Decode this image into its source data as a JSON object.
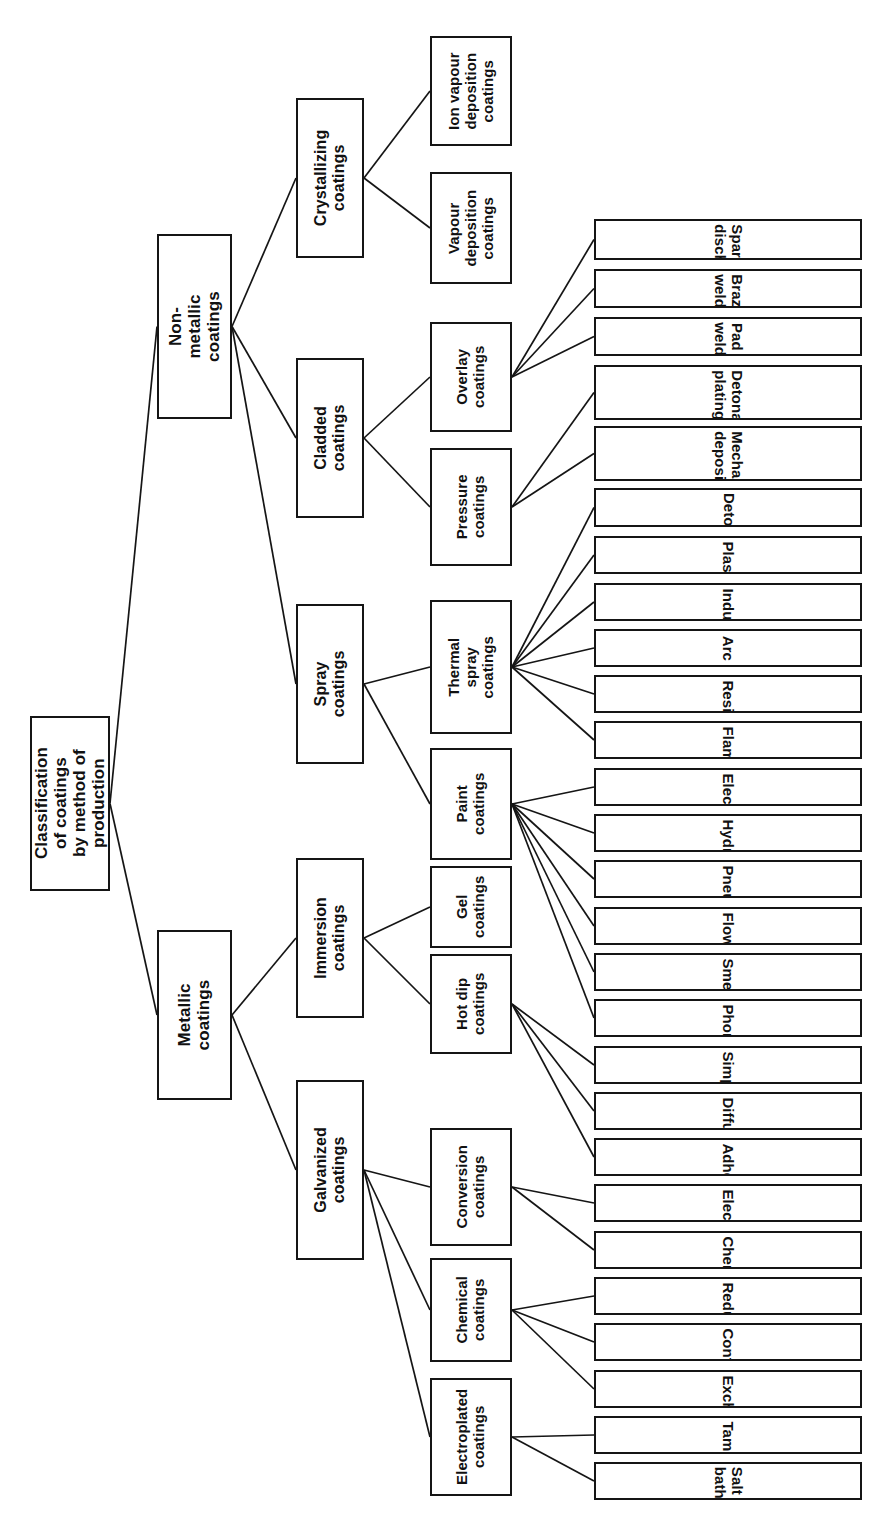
{
  "diagram": {
    "title": "Classification of coatings by method of production",
    "orientation": "rotated-90-ccw",
    "ink_color": "#151515",
    "background_color": "#ffffff"
  },
  "root": {
    "id": "root",
    "label": "Classification of coatings\nby method of production"
  },
  "level1": [
    {
      "id": "non-metallic",
      "label": "Non-metallic\ncoatings"
    },
    {
      "id": "metallic",
      "label": "Metallic\ncoatings"
    }
  ],
  "level2": [
    {
      "id": "crystallizing",
      "label": "Crystallizing\ncoatings",
      "parent": "non-metallic"
    },
    {
      "id": "cladded",
      "label": "Cladded\ncoatings",
      "parent": "non-metallic"
    },
    {
      "id": "spray",
      "label": "Spray\ncoatings",
      "parent": "non-metallic"
    },
    {
      "id": "immersion",
      "label": "Immersion\ncoatings",
      "parent": "metallic"
    },
    {
      "id": "galvanized",
      "label": "Galvanized\ncoatings",
      "parent": "metallic"
    }
  ],
  "level3": [
    {
      "id": "ion-vapour-deposition",
      "label": "Ion vapour\ndeposition\ncoatings",
      "parent": "crystallizing"
    },
    {
      "id": "vapour-deposition",
      "label": "Vapour\ndeposition\ncoatings",
      "parent": "crystallizing"
    },
    {
      "id": "overlay",
      "label": "Overlay\ncoatings",
      "parent": "cladded"
    },
    {
      "id": "pressure",
      "label": "Pressure\ncoatings",
      "parent": "cladded"
    },
    {
      "id": "thermal-spray",
      "label": "Thermal spray\ncoatings",
      "parent": "spray"
    },
    {
      "id": "paint",
      "label": "Paint\ncoatings",
      "parent": "spray"
    },
    {
      "id": "gel",
      "label": "Gel\ncoatings",
      "parent": "immersion"
    },
    {
      "id": "hot-dip",
      "label": "Hot dip\ncoatings",
      "parent": "immersion"
    },
    {
      "id": "conversion",
      "label": "Conversion\ncoatings",
      "parent": "galvanized"
    },
    {
      "id": "chemical-coatings",
      "label": "Chemical\ncoatings",
      "parent": "galvanized"
    },
    {
      "id": "electroplated",
      "label": "Electroplated\ncoatings",
      "parent": "galvanized"
    }
  ],
  "leaves": [
    {
      "id": "spark-discharge",
      "label": "Spark discharge",
      "parent": "overlay"
    },
    {
      "id": "braze-welding",
      "label": "Braze welding",
      "parent": "overlay"
    },
    {
      "id": "pad-welding",
      "label": "Pad welding",
      "parent": "overlay"
    },
    {
      "id": "detonation-plating",
      "label": "Detonation\nplating",
      "parent": "pressure"
    },
    {
      "id": "mechanical-deposition",
      "label": "Mechanical\ndeposition",
      "parent": "pressure"
    },
    {
      "id": "detonation",
      "label": "Detonation",
      "parent": "thermal-spray"
    },
    {
      "id": "plasma",
      "label": "Plasma",
      "parent": "thermal-spray"
    },
    {
      "id": "induction",
      "label": "Induction",
      "parent": "thermal-spray"
    },
    {
      "id": "arc",
      "label": "Arc",
      "parent": "thermal-spray"
    },
    {
      "id": "resistance",
      "label": "Resistance",
      "parent": "thermal-spray"
    },
    {
      "id": "flame",
      "label": "Flame",
      "parent": "thermal-spray"
    },
    {
      "id": "electrostatic",
      "label": "Electrostatic",
      "parent": "paint"
    },
    {
      "id": "hydrodynamic",
      "label": "Hydrodynamic",
      "parent": "paint"
    },
    {
      "id": "pneumatic",
      "label": "Pneumatic",
      "parent": "paint"
    },
    {
      "id": "flow",
      "label": "Flow",
      "parent": "paint"
    },
    {
      "id": "smeared",
      "label": "Smeared",
      "parent": "paint"
    },
    {
      "id": "phoretic",
      "label": "Phoretic",
      "parent": "paint"
    },
    {
      "id": "simple",
      "label": "Simple",
      "parent": "hot-dip"
    },
    {
      "id": "diffusion",
      "label": "Diffusion",
      "parent": "hot-dip"
    },
    {
      "id": "adhesive",
      "label": "Adhesive",
      "parent": "hot-dip"
    },
    {
      "id": "electrochemical",
      "label": "Electrochemical",
      "parent": "conversion"
    },
    {
      "id": "chemical",
      "label": "Chemical",
      "parent": "conversion"
    },
    {
      "id": "reduction",
      "label": "Reduction",
      "parent": "chemical-coatings"
    },
    {
      "id": "contact",
      "label": "Contact",
      "parent": "chemical-coatings"
    },
    {
      "id": "exchange",
      "label": "Exchange",
      "parent": "chemical-coatings"
    },
    {
      "id": "tampon",
      "label": "Tampon",
      "parent": "electroplated"
    },
    {
      "id": "salt-bath",
      "label": "Salt bath",
      "parent": "electroplated"
    }
  ],
  "geometry": {
    "root": {
      "x": 30,
      "y": 716,
      "w": 80,
      "h": 175
    },
    "level1": {
      "non-metallic": {
        "x": 157,
        "y": 234,
        "w": 75,
        "h": 185
      },
      "metallic": {
        "x": 157,
        "y": 930,
        "w": 75,
        "h": 170
      }
    },
    "level2": {
      "crystallizing": {
        "x": 296,
        "y": 98,
        "w": 68,
        "h": 160
      },
      "cladded": {
        "x": 296,
        "y": 358,
        "w": 68,
        "h": 160
      },
      "spray": {
        "x": 296,
        "y": 604,
        "w": 68,
        "h": 160
      },
      "immersion": {
        "x": 296,
        "y": 858,
        "w": 68,
        "h": 160
      },
      "galvanized": {
        "x": 296,
        "y": 1080,
        "w": 68,
        "h": 180
      }
    },
    "level3": {
      "ion-vapour-deposition": {
        "x": 430,
        "y": 36,
        "w": 82,
        "h": 110
      },
      "vapour-deposition": {
        "x": 430,
        "y": 172,
        "w": 82,
        "h": 112
      },
      "overlay": {
        "x": 430,
        "y": 322,
        "w": 82,
        "h": 110
      },
      "pressure": {
        "x": 430,
        "y": 448,
        "w": 82,
        "h": 118
      },
      "thermal-spray": {
        "x": 430,
        "y": 600,
        "w": 82,
        "h": 134
      },
      "paint": {
        "x": 430,
        "y": 748,
        "w": 82,
        "h": 112
      },
      "gel": {
        "x": 430,
        "y": 866,
        "w": 82,
        "h": 82
      },
      "hot-dip": {
        "x": 430,
        "y": 954,
        "w": 82,
        "h": 100
      },
      "conversion": {
        "x": 430,
        "y": 1128,
        "w": 82,
        "h": 118
      },
      "chemical-coatings": {
        "x": 430,
        "y": 1258,
        "w": 82,
        "h": 104
      },
      "electroplated": {
        "x": 430,
        "y": 1378,
        "w": 82,
        "h": 118
      }
    },
    "leafColumn": {
      "x": 594,
      "w": 268
    },
    "leafRows": [
      {
        "id": "spark-discharge",
        "y": 219,
        "h": 48
      },
      {
        "id": "braze-welding",
        "y": 277,
        "h": 46
      },
      {
        "id": "pad-welding",
        "y": 333,
        "h": 46
      },
      {
        "id": "detonation-plating",
        "y": 389,
        "h": 64
      },
      {
        "id": "mechanical-deposition",
        "y": 461,
        "h": 64
      },
      {
        "id": "detonation",
        "y": 533,
        "h": 46
      },
      {
        "id": "plasma",
        "y": 589,
        "h": 44
      },
      {
        "id": "induction",
        "y": 643,
        "h": 44
      },
      {
        "id": "arc",
        "y": 697,
        "h": 44
      },
      {
        "id": "resistance",
        "y": 751,
        "h": 44
      },
      {
        "id": "flame",
        "y": 805,
        "h": 44
      },
      {
        "id": "electrostatic",
        "y": 859,
        "h": 44
      },
      {
        "id": "hydrodynamic",
        "y": 913,
        "h": 44
      },
      {
        "id": "pneumatic",
        "y": 967,
        "h": 44
      },
      {
        "id": "flow",
        "y": 1021,
        "h": 44
      },
      {
        "id": "smeared",
        "y": 1075,
        "h": 44
      },
      {
        "id": "phoretic",
        "y": 1129,
        "h": 44
      },
      {
        "id": "simple",
        "y": 1183,
        "h": 44
      },
      {
        "id": "diffusion",
        "y": 1237,
        "h": 44
      },
      {
        "id": "adhesive",
        "y": 1291,
        "h": 44
      },
      {
        "id": "electrochemical",
        "y": 1345,
        "h": 44
      },
      {
        "id": "chemical",
        "y": 1399,
        "h": 44
      },
      {
        "id": "reduction",
        "y": 1453,
        "h": 44
      },
      {
        "id": "contact",
        "y": 1507,
        "h": 44
      },
      {
        "id": "exchange",
        "y": 1561,
        "h": 44
      },
      {
        "id": "tampon",
        "y": 1615,
        "h": 44
      },
      {
        "id": "salt-bath",
        "y": 1669,
        "h": 44
      }
    ]
  }
}
